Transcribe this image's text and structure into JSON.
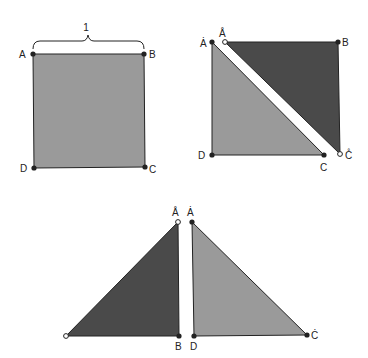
{
  "figure": {
    "colors": {
      "light_fill": "#9a9a9a",
      "dark_fill": "#4a4a4a",
      "stroke": "#222222",
      "background": "#ffffff"
    },
    "panel_square": {
      "side_label": "1",
      "vertices": {
        "A": "A",
        "B": "B",
        "C": "C",
        "D": "D"
      }
    },
    "panel_cut": {
      "labels": {
        "A_dot": "Ȧ",
        "A_ring": "Å",
        "B": "B",
        "C": "C",
        "C_ring": "C̊",
        "D": "D"
      }
    },
    "panel_rearranged": {
      "labels": {
        "A_ring": "Å",
        "A_dot": "Ȧ",
        "B": "B",
        "D": "D",
        "C_dot": "Ċ"
      }
    }
  }
}
